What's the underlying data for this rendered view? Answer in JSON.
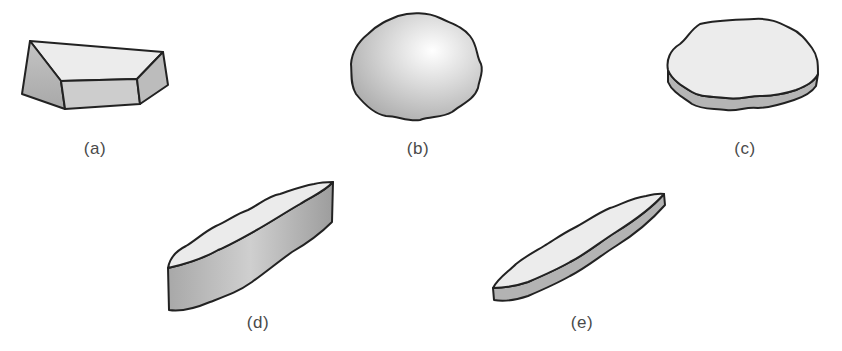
{
  "figure": {
    "panels": [
      {
        "id": "a",
        "label": "(a)",
        "shape": "angular-block",
        "x": 95,
        "y": 139
      },
      {
        "id": "b",
        "label": "(b)",
        "shape": "rounded-sphere",
        "x": 418,
        "y": 139
      },
      {
        "id": "c",
        "label": "(c)",
        "shape": "flat-disc",
        "x": 745,
        "y": 139
      },
      {
        "id": "d",
        "label": "(d)",
        "shape": "elongated-bar",
        "x": 258,
        "y": 313
      },
      {
        "id": "e",
        "label": "(e)",
        "shape": "flat-elongated-blade",
        "x": 582,
        "y": 313
      }
    ],
    "colors": {
      "outline": "#222222",
      "top_face": "#ececec",
      "side_face": "#b8b8b8",
      "label": "#4a4a4a"
    }
  }
}
